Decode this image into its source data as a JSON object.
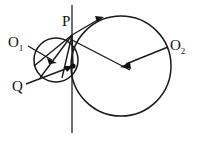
{
  "figure": {
    "background_color": "#ffffff",
    "stroke_color": "#1a1a1a",
    "line_color_vertical": "#4a4a4a",
    "width": 199,
    "height": 142,
    "labels": {
      "p": "P",
      "q": "Q",
      "o1_base": "O",
      "o1_sub": "1",
      "o2_base": "O",
      "o2_sub": "2"
    },
    "geometry": {
      "vertical_line": {
        "x": 72,
        "y_top": 5,
        "y_bottom": 133
      },
      "circle_small": {
        "cx": 56,
        "cy": 60,
        "r": 22
      },
      "circle_large": {
        "cx": 121,
        "cy": 66,
        "r": 50
      },
      "point_p": {
        "x": 72,
        "y": 35
      },
      "point_q": {
        "x": 73,
        "y": 66
      },
      "arc_point": {
        "x": 104,
        "y": 17
      }
    },
    "label_positions": {
      "p": {
        "left": 62,
        "top": 14
      },
      "q": {
        "left": 12,
        "top": 79
      },
      "o1": {
        "left": 8,
        "top": 35
      },
      "o2": {
        "left": 170,
        "top": 38
      }
    }
  }
}
